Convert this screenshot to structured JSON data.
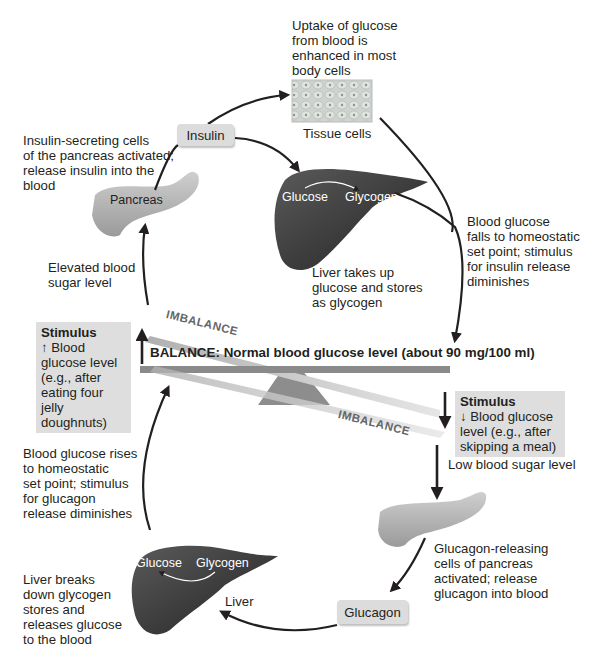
{
  "diagram": {
    "balance_label": "BALANCE: Normal blood glucose level (about 90 mg/100 ml)",
    "imbalance_top": "IMBALANCE",
    "imbalance_bottom": "IMBALANCE",
    "colors": {
      "arrow": "#231f20",
      "hormone_box": "#dcdcdc",
      "stimulus_box": "#dedede",
      "liver": "#3a3a3a",
      "pancreas": "#b8b8b8",
      "beam": "#8a8a8a"
    },
    "top_loop": {
      "tissue_caption": "Uptake of glucose\nfrom blood is\nenhanced in most\nbody cells",
      "tissue_label": "Tissue cells",
      "insulin_label": "Insulin",
      "pancreas_caption": "Insulin-secreting cells\nof the pancreas activated;\nrelease insulin into the\nblood",
      "pancreas_label": "Pancreas",
      "liver_glucose": "Glucose",
      "liver_glycogen": "Glycogen",
      "liver_caption": "Liver takes up\nglucose and stores\nas glycogen",
      "falls_caption": "Blood glucose\nfalls to homeostatic\nset point; stimulus\nfor insulin release\ndiminishes",
      "elevated_caption": "Elevated blood\nsugar level",
      "stimulus_title": "Stimulus",
      "stimulus_text": "↑ Blood\nglucose level\n(e.g., after\neating four\njelly doughnuts)"
    },
    "bottom_loop": {
      "stimulus_title": "Stimulus",
      "stimulus_text": "↓ Blood glucose\nlevel (e.g., after\nskipping a meal)",
      "low_caption": "Low blood sugar level",
      "pancreas_caption": "Glucagon-releasing\ncells of pancreas\nactivated; release\nglucagon into blood",
      "glucagon_label": "Glucagon",
      "liver_label": "Liver",
      "liver_glucose": "Glucose",
      "liver_glycogen": "Glycogen",
      "liver_caption": "Liver breaks\ndown glycogen\nstores and\nreleases glucose\nto the blood",
      "rises_caption": "Blood glucose rises\nto homeostatic\nset point; stimulus\nfor glucagon\nrelease diminishes"
    }
  }
}
